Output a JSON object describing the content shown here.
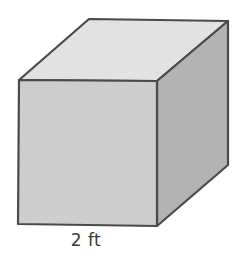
{
  "figure": {
    "shape": "cube",
    "dimension_label": "2 ft",
    "faces": {
      "top_color": "#e2e2e2",
      "front_color": "#cdcdcd",
      "right_color": "#b3b3b3"
    },
    "stroke_color": "#4a4a4a"
  }
}
